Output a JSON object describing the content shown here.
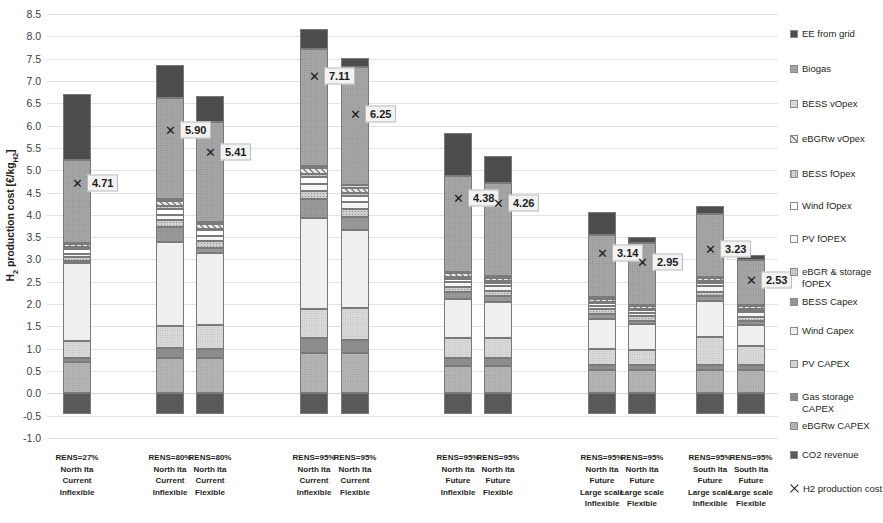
{
  "chart_data": {
    "type": "bar",
    "stacked": true,
    "title": "",
    "xlabel": "",
    "ylabel": "H2 production cost [€/kgH2]",
    "ylim": [
      -1.0,
      8.5
    ],
    "ytick_step": 0.5,
    "ytick_labels": [
      "8.5",
      "8.0",
      "7.5",
      "7.0",
      "6.5",
      "6.0",
      "5.5",
      "5.0",
      "4.5",
      "4.0",
      "3.5",
      "3.0",
      "2.5",
      "2.0",
      "1.5",
      "1.0",
      "0.5",
      "0.0",
      "-0.5",
      "-1.0"
    ],
    "grid": true,
    "legend_position": "right",
    "categories": [
      {
        "id": "c1",
        "lines": [
          "RENS=27%",
          "North Ita",
          "Current",
          "Inflexible"
        ]
      },
      {
        "id": "c2",
        "lines": [
          "RENS=80%",
          "North Ita",
          "Current",
          "Inflexible"
        ]
      },
      {
        "id": "c3",
        "lines": [
          "RENS=80%",
          "North Ita",
          "Current",
          "Flexible"
        ]
      },
      {
        "id": "c4",
        "lines": [
          "RENS=95%",
          "North Ita",
          "Current",
          "Inflexible"
        ]
      },
      {
        "id": "c5",
        "lines": [
          "RENS=95%",
          "North Ita",
          "Current",
          "Flexible"
        ]
      },
      {
        "id": "c6",
        "lines": [
          "RENS=95%",
          "North Ita",
          "Future",
          "Inflexible"
        ]
      },
      {
        "id": "c7",
        "lines": [
          "RENS=95%",
          "North Ita",
          "Future",
          "Flexible"
        ]
      },
      {
        "id": "c8",
        "lines": [
          "RENS=95%",
          "North Ita",
          "Future",
          "Large scale",
          "Inflexible"
        ]
      },
      {
        "id": "c9",
        "lines": [
          "RENS=95%",
          "North Ita",
          "Future",
          "Large scale",
          "Flexible"
        ]
      },
      {
        "id": "c10",
        "lines": [
          "RENS=95%",
          "South Ita",
          "Future",
          "Large scale",
          "Inflexible"
        ]
      },
      {
        "id": "c11",
        "lines": [
          "RENS=95%",
          "South Ita",
          "Future",
          "Large scale",
          "Flexible"
        ]
      }
    ],
    "series": [
      {
        "name": "CO2 revenue",
        "key": "co2",
        "color": "#595959",
        "pattern": "solid",
        "values": [
          -0.46,
          -0.46,
          -0.46,
          -0.46,
          -0.46,
          -0.46,
          -0.46,
          -0.46,
          -0.46,
          -0.46,
          -0.46
        ]
      },
      {
        "name": "eBGRw CAPEX",
        "key": "ebgrw_cap",
        "color": "#b5b5b5",
        "pattern": "grain",
        "values": [
          0.7,
          0.8,
          0.8,
          0.9,
          0.9,
          0.62,
          0.62,
          0.52,
          0.52,
          0.52,
          0.52
        ]
      },
      {
        "name": "Gas storage CAPEX",
        "key": "gas_cap",
        "color": "#8c8c8c",
        "pattern": "solid",
        "values": [
          0.1,
          0.22,
          0.2,
          0.33,
          0.3,
          0.18,
          0.17,
          0.12,
          0.11,
          0.12,
          0.11
        ]
      },
      {
        "name": "PV CAPEX",
        "key": "pv_cap",
        "color": "#d9d9d9",
        "pattern": "grain",
        "values": [
          0.38,
          0.5,
          0.53,
          0.66,
          0.72,
          0.45,
          0.46,
          0.36,
          0.34,
          0.62,
          0.44
        ]
      },
      {
        "name": "Wind Capex",
        "key": "wind_cap",
        "color": "#efefef",
        "pattern": "solid",
        "values": [
          1.74,
          1.88,
          1.62,
          2.04,
          1.74,
          0.86,
          0.8,
          0.66,
          0.58,
          0.8,
          0.46
        ]
      },
      {
        "name": "BESS Capex",
        "key": "bess_cap",
        "color": "#9a9a9a",
        "pattern": "grain",
        "values": [
          0.04,
          0.32,
          0.1,
          0.42,
          0.3,
          0.16,
          0.13,
          0.12,
          0.08,
          0.12,
          0.09
        ]
      },
      {
        "name": "eBGR & storage fOPEX",
        "key": "ebgr_fop",
        "color": "#cfcfcf",
        "pattern": "dots",
        "values": [
          0.1,
          0.16,
          0.16,
          0.18,
          0.18,
          0.12,
          0.12,
          0.1,
          0.1,
          0.1,
          0.1
        ]
      },
      {
        "name": "PV fOPEX",
        "key": "pv_fop",
        "color": "#f5f5f5",
        "pattern": "solid",
        "values": [
          0.07,
          0.12,
          0.12,
          0.15,
          0.15,
          0.1,
          0.1,
          0.08,
          0.08,
          0.13,
          0.1
        ]
      },
      {
        "name": "Wind fOpex",
        "key": "wind_fop",
        "color": "#ffffff",
        "pattern": "solid",
        "values": [
          0.11,
          0.14,
          0.12,
          0.16,
          0.14,
          0.08,
          0.07,
          0.06,
          0.05,
          0.07,
          0.04
        ]
      },
      {
        "name": "BESS fOpex",
        "key": "bess_fop",
        "color": "#d2d2d2",
        "pattern": "vline",
        "values": [
          0.03,
          0.06,
          0.04,
          0.08,
          0.06,
          0.04,
          0.04,
          0.03,
          0.03,
          0.03,
          0.03
        ]
      },
      {
        "name": "eBGRw vOpex",
        "key": "ebgrw_vop",
        "color": "#e8e8e8",
        "pattern": "hatch",
        "values": [
          0.07,
          0.1,
          0.1,
          0.12,
          0.12,
          0.08,
          0.08,
          0.07,
          0.07,
          0.07,
          0.07
        ]
      },
      {
        "name": "BESS vOpex",
        "key": "bess_vop",
        "color": "#dedede",
        "pattern": "grain",
        "values": [
          0.03,
          0.05,
          0.04,
          0.06,
          0.05,
          0.03,
          0.03,
          0.03,
          0.02,
          0.03,
          0.02
        ]
      },
      {
        "name": "Biogas",
        "key": "biogas",
        "color": "#a6a6a6",
        "pattern": "grain",
        "values": [
          1.86,
          2.26,
          2.24,
          2.62,
          2.66,
          2.14,
          2.1,
          1.4,
          1.38,
          1.4,
          1.0
        ]
      },
      {
        "name": "EE from grid",
        "key": "ee_grid",
        "color": "#4d4d4d",
        "pattern": "solid",
        "values": [
          1.48,
          0.75,
          0.6,
          0.45,
          0.19,
          0.98,
          0.6,
          0.52,
          0.15,
          0.19,
          0.12
        ]
      }
    ],
    "markers": {
      "name": "H2 production cost",
      "symbol": "x",
      "values": [
        4.71,
        5.9,
        5.41,
        7.11,
        6.25,
        4.38,
        4.26,
        3.14,
        2.95,
        3.23,
        2.53
      ],
      "labels": [
        "4.71",
        "5.90",
        "5.41",
        "7.11",
        "6.25",
        "4.38",
        "4.26",
        "3.14",
        "2.95",
        "3.23",
        "2.53"
      ]
    },
    "legend_items": [
      {
        "label": "EE from grid",
        "color": "#4d4d4d",
        "pattern": "solid"
      },
      {
        "label": "Biogas",
        "color": "#a6a6a6",
        "pattern": "grain"
      },
      {
        "label": "BESS vOpex",
        "color": "#dedede",
        "pattern": "grain"
      },
      {
        "label": "eBGRw vOpex",
        "color": "#e8e8e8",
        "pattern": "hatch"
      },
      {
        "label": "BESS fOpex",
        "color": "#d2d2d2",
        "pattern": "vline"
      },
      {
        "label": "Wind fOpex",
        "color": "#ffffff",
        "pattern": "solid"
      },
      {
        "label": "PV fOPEX",
        "color": "#f5f5f5",
        "pattern": "solid"
      },
      {
        "label": "eBGR & storage fOPEX",
        "color": "#cfcfcf",
        "pattern": "dots"
      },
      {
        "label": "BESS Capex",
        "color": "#9a9a9a",
        "pattern": "grain"
      },
      {
        "label": "Wind Capex",
        "color": "#efefef",
        "pattern": "solid"
      },
      {
        "label": "PV CAPEX",
        "color": "#d9d9d9",
        "pattern": "grain"
      },
      {
        "label": "Gas storage CAPEX",
        "color": "#8c8c8c",
        "pattern": "solid"
      },
      {
        "label": "eBGRw CAPEX",
        "color": "#b5b5b5",
        "pattern": "grain"
      },
      {
        "label": "CO2 revenue",
        "color": "#595959",
        "pattern": "solid"
      },
      {
        "label": "H2 production cost",
        "color": "#1a1a1a",
        "pattern": "marker-x"
      }
    ]
  },
  "layout": {
    "bar_x": [
      63,
      156,
      196,
      300,
      341,
      444,
      484,
      588,
      628,
      696,
      737
    ],
    "cat_x": [
      48,
      141,
      181,
      285,
      326,
      429,
      469,
      573,
      613,
      681,
      722
    ],
    "legend_y": [
      0,
      35,
      70,
      105,
      140,
      172,
      205,
      238,
      268,
      297,
      330,
      363,
      392,
      421,
      455
    ]
  }
}
